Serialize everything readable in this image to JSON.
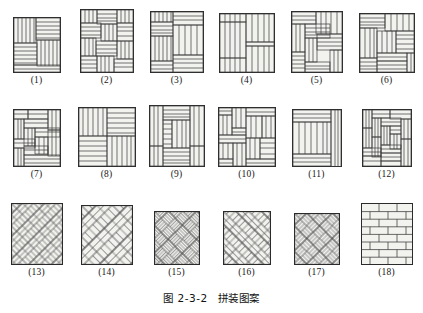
{
  "figure": {
    "caption_number": "图 2-3-2",
    "caption_title": "拼装图案",
    "caption_full": "图 2-3-2  拼装图案",
    "width_px": 423,
    "height_px": 313,
    "background_color": "#ffffff",
    "stroke_color": "#2b2b2b",
    "fill_color": "#f2f2ef",
    "hatch_color": "#555555"
  },
  "layout": {
    "rows": 3,
    "columns_per_row": [
      6,
      6,
      6
    ],
    "row_tops_px": [
      16,
      108,
      202
    ],
    "label_rows_px": [
      84,
      176,
      270
    ]
  },
  "patterns": [
    {
      "index": 1,
      "label": "(1)",
      "name": "pinwheel-4-block-small",
      "tile_px": {
        "w": 48,
        "h": 56
      },
      "type": "pinwheel"
    },
    {
      "index": 2,
      "label": "(2)",
      "name": "basketweave-offset-3x3",
      "tile_px": {
        "w": 54,
        "h": 64
      },
      "type": "basketweave-offset"
    },
    {
      "index": 3,
      "label": "(3)",
      "name": "quarter-block-rotating",
      "tile_px": {
        "w": 54,
        "h": 62
      },
      "type": "quarter-rotating"
    },
    {
      "index": 4,
      "label": "(4)",
      "name": "vertical-plank-split",
      "tile_px": {
        "w": 56,
        "h": 60
      },
      "type": "vertical-split"
    },
    {
      "index": 5,
      "label": "(5)",
      "name": "pinwheel-nested",
      "tile_px": {
        "w": 52,
        "h": 62
      },
      "type": "pinwheel-nested"
    },
    {
      "index": 6,
      "label": "(6)",
      "name": "pinwheel-mixed-blocks",
      "tile_px": {
        "w": 56,
        "h": 60
      },
      "type": "pinwheel-mixed"
    },
    {
      "index": 7,
      "label": "(7)",
      "name": "interlock-weave-small",
      "tile_px": {
        "w": 48,
        "h": 58
      },
      "type": "interlock"
    },
    {
      "index": 8,
      "label": "(8)",
      "name": "basketweave-2x2",
      "tile_px": {
        "w": 58,
        "h": 60
      },
      "type": "basketweave2x2"
    },
    {
      "index": 9,
      "label": "(9)",
      "name": "pinwheel-center-block",
      "tile_px": {
        "w": 56,
        "h": 62
      },
      "type": "pinwheel-center"
    },
    {
      "index": 10,
      "label": "(10)",
      "name": "double-pinwheel-quad",
      "tile_px": {
        "w": 58,
        "h": 60
      },
      "type": "quad-pinwheel"
    },
    {
      "index": 11,
      "label": "(11)",
      "name": "border-frame-planks",
      "tile_px": {
        "w": 50,
        "h": 58
      },
      "type": "frame-planks"
    },
    {
      "index": 12,
      "label": "(12)",
      "name": "spiral-herringbone-block",
      "tile_px": {
        "w": 50,
        "h": 58
      },
      "type": "spiral-block"
    },
    {
      "index": 13,
      "label": "(13)",
      "name": "herringbone-diagonal",
      "tile_px": {
        "w": 52,
        "h": 62
      },
      "type": "herringbone"
    },
    {
      "index": 14,
      "label": "(14)",
      "name": "herringbone-wide-plank",
      "tile_px": {
        "w": 52,
        "h": 60
      },
      "type": "herringbone-wide"
    },
    {
      "index": 15,
      "label": "(15)",
      "name": "diagonal-basketweave-fine",
      "tile_px": {
        "w": 46,
        "h": 54
      },
      "type": "diag-basketweave"
    },
    {
      "index": 16,
      "label": "(16)",
      "name": "double-herringbone",
      "tile_px": {
        "w": 48,
        "h": 54
      },
      "type": "herringbone-double"
    },
    {
      "index": 17,
      "label": "(17)",
      "name": "diagonal-lattice-weave",
      "tile_px": {
        "w": 46,
        "h": 52
      },
      "type": "diag-lattice"
    },
    {
      "index": 18,
      "label": "(18)",
      "name": "running-bond-brick",
      "tile_px": {
        "w": 52,
        "h": 62
      },
      "type": "running-bond"
    }
  ]
}
